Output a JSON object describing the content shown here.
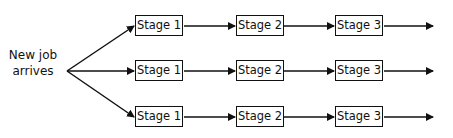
{
  "diagram": {
    "source_label": [
      "New job",
      "arrives"
    ],
    "rows": [
      {
        "stages": [
          "Stage 1",
          "Stage 2",
          "Stage 3"
        ]
      },
      {
        "stages": [
          "Stage 1",
          "Stage 2",
          "Stage 3"
        ]
      },
      {
        "stages": [
          "Stage 1",
          "Stage 2",
          "Stage 3"
        ]
      }
    ]
  }
}
